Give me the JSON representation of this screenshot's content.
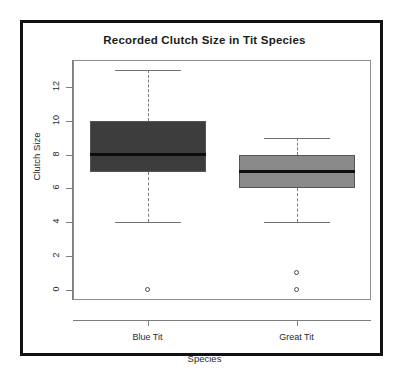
{
  "chart_data": {
    "type": "box",
    "title": "Recorded Clutch Size in Tit Species",
    "xlabel": "Species",
    "ylabel": "Clutch Size",
    "categories": [
      "Blue Tit",
      "Great Tit"
    ],
    "ylim": [
      -0.6,
      13.6
    ],
    "yticks": [
      0,
      2,
      4,
      6,
      8,
      10,
      12
    ],
    "ytick_labels": [
      "0",
      "2",
      "4",
      "6",
      "8",
      "10",
      "12"
    ],
    "grid": false,
    "legend": "none",
    "series": [
      {
        "name": "Blue Tit",
        "color": "#3d3d3d",
        "whisker_low": 4,
        "q1": 7,
        "median": 8,
        "q3": 10,
        "whisker_high": 13,
        "outliers": [
          0
        ]
      },
      {
        "name": "Great Tit",
        "color": "#8a8a8a",
        "whisker_low": 4,
        "q1": 6,
        "median": 7,
        "q3": 8,
        "whisker_high": 9,
        "outliers": [
          0,
          1
        ]
      }
    ]
  },
  "colors": {
    "outer_border": "#111111",
    "plot_frame": "#8e8e8e",
    "axis": "#7d7d7d",
    "median": "#0d0d0d",
    "whisker": "#7a7a7a",
    "background": "#ffffff"
  }
}
